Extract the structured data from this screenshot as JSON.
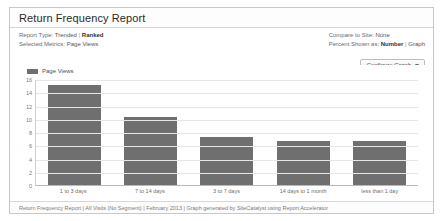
{
  "panel": {
    "title": "Return Frequency Report"
  },
  "meta": {
    "left": [
      {
        "label": "Report Type:",
        "option_a": "Trended",
        "separator": "|",
        "option_b": "Ranked",
        "active": "b"
      },
      {
        "label": "Selected Metrics:",
        "value": "Page Views"
      }
    ],
    "right": [
      {
        "label": "Compare to Site:",
        "value": "None"
      },
      {
        "label": "Percent Shown as:",
        "option_a": "Number",
        "separator": "|",
        "option_b": "Graph",
        "active": "a"
      }
    ]
  },
  "toolbar": {
    "configure_graph_label": "Configure Graph",
    "caret_icon": "chevron-down-icon"
  },
  "legend": {
    "items": [
      {
        "label": "Page Views",
        "color": "#6f6f6f"
      }
    ]
  },
  "footer": {
    "text": "Return Frequency Report | All Visits (No Segment) | February 2013 | Graph generated by SiteCatalyst using Report Accelerator"
  },
  "chart_data": {
    "type": "bar",
    "title": "Return Frequency Report",
    "xlabel": "",
    "ylabel": "",
    "ylim": [
      0,
      16
    ],
    "yticks": [
      16,
      14,
      12,
      10,
      8,
      6,
      4,
      2,
      0
    ],
    "grid": true,
    "legend_position": "top-left",
    "bar_color": "#6f6f6f",
    "categories": [
      "1 to 3 days",
      "7 to 14 days",
      "3 to 7 days",
      "14 days to 1 month",
      "less than 1 day"
    ],
    "series": [
      {
        "name": "Page Views",
        "values": [
          15.1,
          10.2,
          7.3,
          6.6,
          6.6
        ]
      }
    ]
  }
}
